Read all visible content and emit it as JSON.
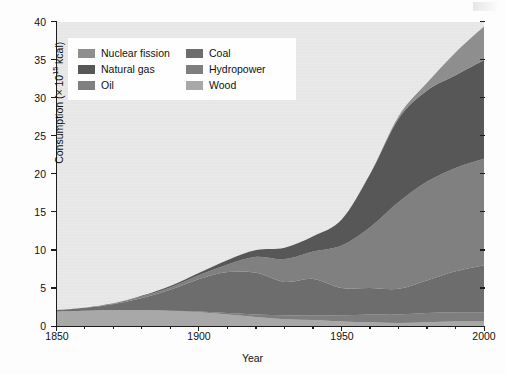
{
  "figure": {
    "background": "#fdfdfd",
    "plot_background": "#e9e9e9"
  },
  "axis_titles": {
    "x": "Year",
    "y_prefix": "Consumption (× 10",
    "y_exponent": "15",
    "y_suffix": " kcal)"
  },
  "y_ticks": [
    "0",
    "5",
    "10",
    "15",
    "20",
    "25",
    "30",
    "35",
    "40"
  ],
  "x_ticks": [
    "1850",
    "1900",
    "1950",
    "2000"
  ],
  "legend": {
    "items": [
      {
        "label": "Nuclear fission",
        "color": "#8e8e8e"
      },
      {
        "label": "Coal",
        "color": "#6d6d6d"
      },
      {
        "label": "Natural gas",
        "color": "#575757"
      },
      {
        "label": "Hydropower",
        "color": "#7e7e7e"
      },
      {
        "label": "Oil",
        "color": "#808080"
      },
      {
        "label": "Wood",
        "color": "#a8a8a8"
      }
    ]
  },
  "chart_data": {
    "type": "area",
    "title": "",
    "xlabel": "Year",
    "ylabel": "Consumption (× 10^15 kcal)",
    "xlim": [
      1850,
      2000
    ],
    "ylim": [
      0,
      40
    ],
    "ytick_step": 5,
    "xtick_step": 50,
    "x_minor_step": 10,
    "y_minor_step": 5,
    "grid": false,
    "stacked": true,
    "legend_position": "upper-left-inside",
    "stack_order_bottom_to_top": [
      "Wood",
      "Hydropower",
      "Coal",
      "Oil",
      "Natural gas",
      "Nuclear fission"
    ],
    "x": [
      1850,
      1860,
      1870,
      1880,
      1890,
      1900,
      1910,
      1920,
      1930,
      1940,
      1950,
      1960,
      1970,
      1980,
      1990,
      2000
    ],
    "series": [
      {
        "name": "Wood",
        "color": "#a8a8a8",
        "values": [
          1.9,
          2.0,
          2.1,
          2.1,
          2.0,
          1.8,
          1.5,
          1.2,
          0.9,
          0.8,
          0.6,
          0.5,
          0.4,
          0.5,
          0.6,
          0.6
        ]
      },
      {
        "name": "Hydropower",
        "color": "#7e7e7e",
        "values": [
          0.0,
          0.0,
          0.0,
          0.0,
          0.0,
          0.1,
          0.2,
          0.3,
          0.5,
          0.6,
          0.8,
          1.0,
          1.1,
          1.2,
          1.2,
          1.2
        ]
      },
      {
        "name": "Coal",
        "color": "#6d6d6d",
        "values": [
          0.2,
          0.4,
          0.8,
          1.6,
          2.8,
          4.3,
          5.4,
          5.5,
          4.4,
          4.8,
          3.6,
          3.5,
          3.4,
          4.3,
          5.4,
          6.2
        ]
      },
      {
        "name": "Oil",
        "color": "#808080",
        "values": [
          0.0,
          0.0,
          0.1,
          0.2,
          0.3,
          0.5,
          1.0,
          2.1,
          3.0,
          3.6,
          5.6,
          8.0,
          11.4,
          13.0,
          13.6,
          14.0
        ]
      },
      {
        "name": "Natural gas",
        "color": "#575757",
        "values": [
          0.0,
          0.0,
          0.0,
          0.1,
          0.2,
          0.3,
          0.6,
          0.9,
          1.5,
          2.0,
          3.4,
          7.0,
          11.0,
          12.0,
          12.2,
          13.0
        ]
      },
      {
        "name": "Nuclear fission",
        "color": "#8e8e8e",
        "values": [
          0.0,
          0.0,
          0.0,
          0.0,
          0.0,
          0.0,
          0.0,
          0.0,
          0.0,
          0.0,
          0.0,
          0.0,
          0.3,
          1.0,
          3.0,
          4.4
        ]
      }
    ],
    "totals": [
      2.1,
      2.4,
      3.0,
      4.0,
      5.3,
      7.0,
      8.7,
      10.0,
      10.3,
      11.8,
      14.0,
      20.0,
      27.6,
      32.0,
      36.0,
      39.4
    ]
  }
}
